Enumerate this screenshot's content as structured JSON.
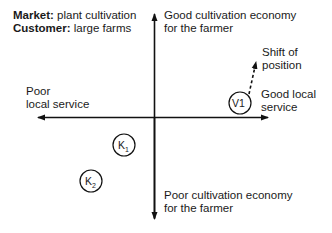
{
  "header": {
    "market_label": "Market:",
    "market_value": " plant cultivation",
    "customer_label": "Customer:",
    "customer_value": " large farms"
  },
  "axes": {
    "top": [
      "Good cultivation economy",
      "for the farmer"
    ],
    "bottom": [
      "Poor cultivation economy",
      "for the farmer"
    ],
    "left": [
      "Poor",
      "local service"
    ],
    "right": [
      "Good local",
      "service"
    ]
  },
  "annotation": [
    "Shift of",
    "position"
  ],
  "nodes": [
    {
      "id": "V1",
      "main": "V1",
      "sub": ""
    },
    {
      "id": "K1",
      "main": "K",
      "sub": "1"
    },
    {
      "id": "K2",
      "main": "K",
      "sub": "2"
    }
  ]
}
